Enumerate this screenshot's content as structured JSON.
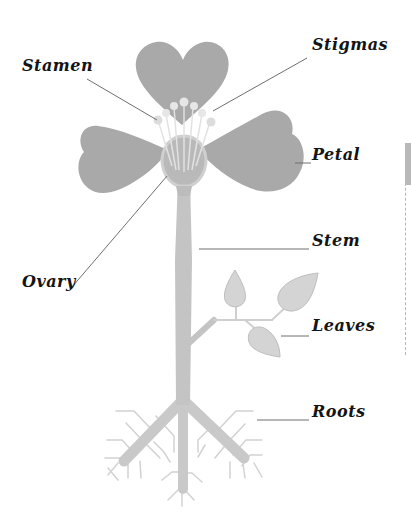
{
  "colors": {
    "petal": "#a9a9a9",
    "stem": "#c4c4c4",
    "leaf": "#d4d4d4",
    "leaf_outline": "#bdbdbd",
    "stamen": "#d6d6d6",
    "ovary": "#c6c6c6",
    "roots": "#c9c9c9",
    "root_hairs": "#d2d2d2",
    "leader_line": "#6e6e6e",
    "label_text": "#141414"
  },
  "labels": {
    "stamen": "Stamen",
    "stigmas": "Stigmas",
    "petal": "Petal",
    "stem": "Stem",
    "ovary": "Ovary",
    "leaves": "Leaves",
    "roots": "Roots"
  },
  "parts": [
    {
      "id": "stamen",
      "label": "Stamen",
      "side": "left"
    },
    {
      "id": "stigmas",
      "label": "Stigmas",
      "side": "right"
    },
    {
      "id": "petal",
      "label": "Petal",
      "side": "right"
    },
    {
      "id": "stem",
      "label": "Stem",
      "side": "right"
    },
    {
      "id": "ovary",
      "label": "Ovary",
      "side": "left"
    },
    {
      "id": "leaves",
      "label": "Leaves",
      "side": "right"
    },
    {
      "id": "roots",
      "label": "Roots",
      "side": "right"
    }
  ]
}
